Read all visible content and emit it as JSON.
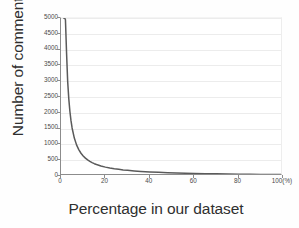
{
  "chart_data": {
    "type": "line",
    "title": "",
    "xlabel": "Percentage in our dataset",
    "ylabel": "Number of comments",
    "xlim": [
      0,
      100
    ],
    "ylim": [
      0,
      5000
    ],
    "grid": true,
    "legend": "none",
    "x_unit_suffix": "(%)",
    "xticks": [
      0,
      20,
      40,
      60,
      80,
      100
    ],
    "xtick_labels": [
      "0",
      "20",
      "40",
      "60",
      "80",
      "100(%)"
    ],
    "yticks": [
      0,
      500,
      1000,
      1500,
      2000,
      2500,
      3000,
      3500,
      4000,
      4500,
      5000
    ],
    "ytick_labels": [
      "0",
      "500",
      "1000",
      "1500",
      "2000",
      "2500",
      "3000",
      "3500",
      "4000",
      "4500",
      "5000"
    ],
    "series": [
      {
        "name": "Number of comments",
        "color": "#5a5a5a",
        "x": [
          1.2,
          1.6,
          2.0,
          2.5,
          3.0,
          3.5,
          4.0,
          4.5,
          5.0,
          6.0,
          7.0,
          8.0,
          9.0,
          10.0,
          11.0,
          12.0,
          13.0,
          14.0,
          15.0,
          16.0,
          18.0,
          20.0,
          22.0,
          24.0,
          26.0,
          28.0,
          30.0,
          33.0,
          36.0,
          40.0,
          44.0,
          48.0,
          52.0,
          56.0,
          60.0,
          65.0,
          70.0,
          75.0,
          80.0,
          85.0,
          90.0,
          95.0,
          100.0
        ],
        "y": [
          5000,
          5000,
          4950,
          3900,
          3000,
          2450,
          2050,
          1750,
          1520,
          1200,
          985,
          835,
          720,
          635,
          565,
          508,
          462,
          423,
          390,
          362,
          316,
          281,
          253,
          229,
          210,
          193,
          179,
          161,
          146,
          130,
          117,
          106,
          97,
          89,
          83,
          75,
          68,
          63,
          58,
          54,
          50,
          47,
          44
        ]
      }
    ]
  },
  "axes": {
    "ylabel_text": "Number of comments",
    "xlabel_text": "Percentage in our dataset"
  }
}
